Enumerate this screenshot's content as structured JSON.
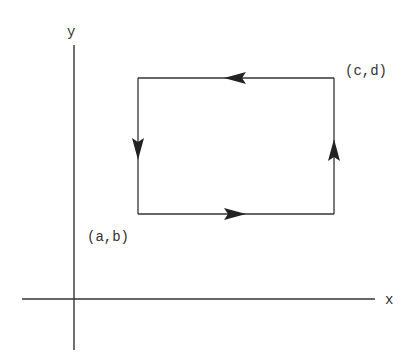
{
  "diagram": {
    "type": "closed-rectangular-path-on-axes",
    "axes": {
      "x_label": "x",
      "y_label": "y"
    },
    "rectangle": {
      "lower_left_label": "(a,b)",
      "upper_right_label": "(c,d)",
      "orientation": "counterclockwise",
      "edges": [
        {
          "name": "bottom",
          "direction": "right"
        },
        {
          "name": "right",
          "direction": "up"
        },
        {
          "name": "top",
          "direction": "left"
        },
        {
          "name": "left",
          "direction": "down"
        }
      ]
    },
    "colors": {
      "line": "#333333",
      "background": "#ffffff"
    }
  }
}
